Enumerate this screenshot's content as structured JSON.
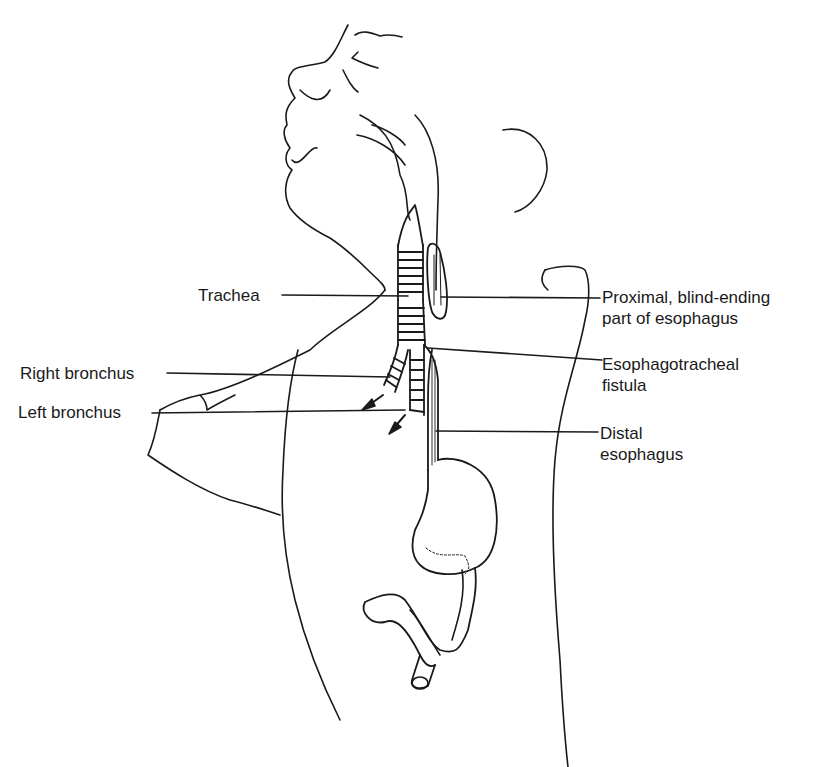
{
  "figure": {
    "type": "anatomical line drawing",
    "stroke_color": "#1a1a1a",
    "background": "#ffffff"
  },
  "labels": {
    "trachea": "Trachea",
    "right_bronchus": "Right bronchus",
    "left_bronchus": "Left bronchus",
    "proximal_line1": "Proximal, blind-ending",
    "proximal_line2": "part of esophagus",
    "fistula_line1": "Esophagotracheal",
    "fistula_line2": "fistula",
    "distal_line1": "Distal",
    "distal_line2": "esophagus"
  }
}
